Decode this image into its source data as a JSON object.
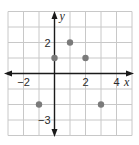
{
  "chart_data": {
    "type": "scatter",
    "title": "",
    "xlabel": "x",
    "ylabel": "y",
    "xlim": [
      -3,
      5
    ],
    "ylim": [
      -4,
      4
    ],
    "grid": true,
    "grid_step": 1,
    "x_tick_labels": [
      {
        "value": -2,
        "label": "−2"
      },
      {
        "value": 2,
        "label": "2"
      },
      {
        "value": 4,
        "label": "4"
      }
    ],
    "y_tick_labels": [
      {
        "value": 2,
        "label": "2"
      },
      {
        "value": -3,
        "label": "−3"
      }
    ],
    "points": [
      {
        "x": -1,
        "y": -2
      },
      {
        "x": 0,
        "y": 1
      },
      {
        "x": 1,
        "y": 2
      },
      {
        "x": 2,
        "y": 1
      },
      {
        "x": 3,
        "y": -2
      }
    ],
    "colors": {
      "grid": "#c8c8c8",
      "axis": "#1a1a1a",
      "point": "#7a7a7a"
    }
  }
}
